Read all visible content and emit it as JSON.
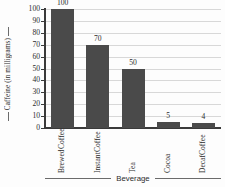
{
  "chart_data": {
    "type": "bar",
    "title": "",
    "xlabel": "Beverage",
    "ylabel": "Caffeine (in milligrams)",
    "categories": [
      "Brewed Coffee",
      "Instant Coffee",
      "Tea",
      "Cocoa",
      "Decaf Coffee"
    ],
    "category_lines": [
      [
        "Brewed",
        "Coffee"
      ],
      [
        "Instant",
        "Coffee"
      ],
      [
        "Tea"
      ],
      [
        "Cocoa"
      ],
      [
        "Decaf",
        "Coffee"
      ]
    ],
    "values": [
      100,
      70,
      50,
      5,
      4
    ],
    "value_labels": [
      "100",
      "70",
      "50",
      "5",
      "4"
    ],
    "ylim": [
      0,
      100
    ],
    "yticks": [
      0,
      10,
      20,
      30,
      40,
      50,
      60,
      70,
      80,
      90,
      100
    ],
    "ytick_labels": [
      "0",
      "10",
      "20",
      "30",
      "40",
      "50",
      "60",
      "70",
      "80",
      "90",
      "100"
    ],
    "grid": true,
    "legend": "none",
    "colors": {
      "bar": "#4a4a4a",
      "grid": "#d8d8d8",
      "axis": "#3a3a3a",
      "background": "#fdfdfd",
      "text": "#2b2b2b"
    }
  }
}
